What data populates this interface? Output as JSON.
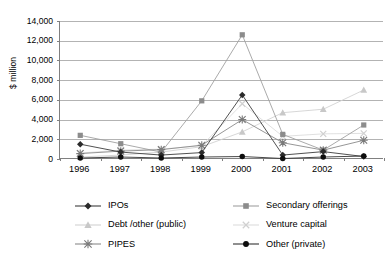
{
  "chart_data": {
    "type": "line",
    "title": "",
    "subtitle": "",
    "xlabel": "",
    "ylabel": "$ million",
    "categories": [
      "1996",
      "1997",
      "1998",
      "1999",
      "2000",
      "2001",
      "2002",
      "2003"
    ],
    "x": [
      1996,
      1997,
      1998,
      1999,
      2000,
      2001,
      2002,
      2003
    ],
    "ylim": [
      0,
      14000
    ],
    "yticks": [
      0,
      2000,
      4000,
      6000,
      8000,
      10000,
      12000,
      14000
    ],
    "ytick_labels": [
      "0",
      "2,000",
      "4,000",
      "6,000",
      "8,000",
      "10,000",
      "12,000",
      "14,000"
    ],
    "grid": "horizontal",
    "legend_position": "bottom",
    "legend_columns": 2,
    "series": [
      {
        "name": "IPOs",
        "marker": "diamond",
        "color": "#3d3d3d",
        "marker_color": "#2b2b2b",
        "values": [
          1500,
          700,
          400,
          650,
          6500,
          400,
          750,
          250
        ]
      },
      {
        "name": "Secondary offerings",
        "marker": "square",
        "color": "#a0a0a0",
        "marker_color": "#8c8c8c",
        "values": [
          2400,
          1550,
          700,
          5900,
          12600,
          2500,
          900,
          3450
        ]
      },
      {
        "name": "Debt /other (public)",
        "marker": "triangle",
        "color": "#d2d2d2",
        "marker_color": "#c8c8c8",
        "values": [
          200,
          400,
          700,
          1250,
          2750,
          4700,
          5050,
          7000
        ]
      },
      {
        "name": "Venture capital",
        "marker": "x",
        "color": "#dcdcdc",
        "marker_color": "#d0d0d0",
        "values": [
          600,
          900,
          1000,
          1350,
          5600,
          2300,
          2550,
          2600
        ]
      },
      {
        "name": "PIPES",
        "marker": "asterisk",
        "color": "#8a8a8a",
        "marker_color": "#7a7a7a",
        "values": [
          550,
          800,
          950,
          1400,
          4000,
          1650,
          900,
          1900
        ]
      },
      {
        "name": "Other (private)",
        "marker": "circle",
        "color": "#333333",
        "marker_color": "#0d0d0d",
        "values": [
          100,
          200,
          100,
          200,
          250,
          50,
          200,
          300
        ]
      }
    ]
  },
  "legend": {
    "items": [
      {
        "label": "IPOs"
      },
      {
        "label": "Secondary offerings"
      },
      {
        "label": "Debt /other (public)"
      },
      {
        "label": "Venture capital"
      },
      {
        "label": "PIPES"
      },
      {
        "label": "Other (private)"
      }
    ]
  },
  "axes": {
    "y_title": "$ million"
  },
  "colors": {
    "background": "#ffffff",
    "gridline": "#b3b3b3",
    "axis": "#808080",
    "text": "#000000"
  }
}
